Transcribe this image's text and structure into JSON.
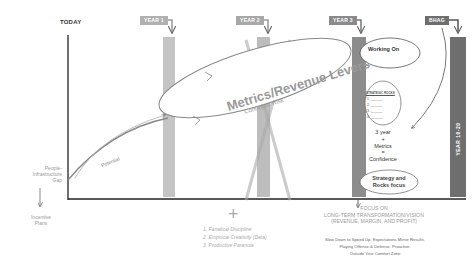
{
  "timeline": {
    "today_label": "TODAY",
    "markers": [
      {
        "label": "YEAR 1",
        "color": "#b0b0b0"
      },
      {
        "label": "YEAR 2",
        "color": "#a8a8a8"
      },
      {
        "label": "YEAR 3",
        "color": "#8a8a8a"
      },
      {
        "label": "BHAG",
        "color": "#6e6e6e"
      }
    ],
    "bhag_bar_label": "YEAR 10-20"
  },
  "ellipse": {
    "title": "Metrics/Revenue Levers",
    "subtitle": "Controlled Risk"
  },
  "potential_label": "Potential",
  "left_axis": {
    "gap_label": [
      "People-",
      "Infrastructure",
      "Gap"
    ],
    "incentive_label": [
      "Incentive",
      "Plans"
    ]
  },
  "right_panel": {
    "working_on": "Working On",
    "rocks_title": "STRATEGIC ROCKS",
    "rocks_items": [
      "1. ______",
      "2. ______",
      "3. ______",
      "4. ______",
      "5. ______"
    ],
    "confidence_lines": [
      "3 year",
      "+",
      "Metrics",
      "=",
      "Confidence"
    ],
    "strategy_lines": [
      "Strategy and",
      "Rocks focus"
    ]
  },
  "plus_symbol": "+",
  "principles": [
    "1. Fanatical Discipline",
    "2. Empirical Creativity (Data)",
    "3. Productive Paranoia"
  ],
  "focus": {
    "line1": "FOCUS ON",
    "line2": "LONG-TERM TRANSFORMATION/VISION",
    "line3": "(REVENUE, MARGIN, AND PROFIT)",
    "sub1": "Slow Down to Speed Up. Expectations Mirror Results.",
    "sub2": "Playing Offense & Defense. Proactive.",
    "sub3": "Outside Your Comfort Zone"
  }
}
